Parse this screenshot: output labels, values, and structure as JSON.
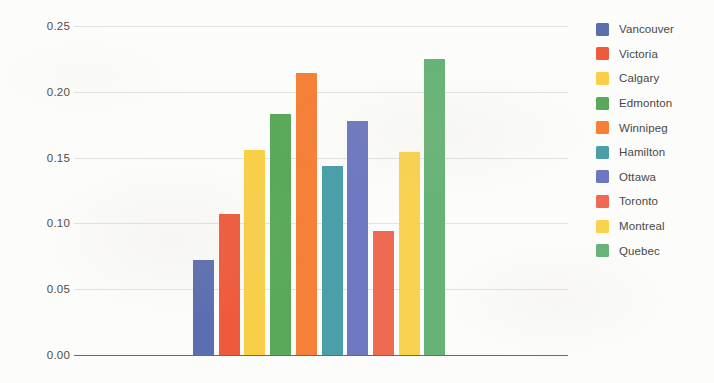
{
  "chart_data": {
    "type": "bar",
    "title": "",
    "xlabel": "",
    "ylabel": "",
    "ylim": [
      0.0,
      0.25
    ],
    "grid": true,
    "legend_position": "right",
    "categories": [
      "Vancouver",
      "Victoria",
      "Calgary",
      "Edmonton",
      "Winnipeg",
      "Hamilton",
      "Ottawa",
      "Toronto",
      "Montreal",
      "Quebec"
    ],
    "values": [
      0.072,
      0.107,
      0.156,
      0.183,
      0.214,
      0.144,
      0.178,
      0.094,
      0.154,
      0.225
    ],
    "colors": [
      "#5b6eb0",
      "#f05a3c",
      "#f9cf4a",
      "#5aa95a",
      "#f58038",
      "#4a9fa8",
      "#6e78c0",
      "#ee6a52",
      "#f9d24f",
      "#67b377"
    ],
    "ytick_labels": [
      "0.25",
      "0.20",
      "0.15",
      "0.10",
      "0.05",
      "0.00"
    ],
    "ytick_values": [
      0.25,
      0.2,
      0.15,
      0.1,
      0.05,
      0.0
    ],
    "bars": [
      {
        "label": "Vancouver",
        "value": 0.072,
        "color": "#5b6eb0"
      },
      {
        "label": "Victoria",
        "value": 0.107,
        "color": "#f05a3c"
      },
      {
        "label": "Calgary",
        "value": 0.156,
        "color": "#f9cf4a"
      },
      {
        "label": "Edmonton",
        "value": 0.183,
        "color": "#5aa95a"
      },
      {
        "label": "Winnipeg",
        "value": 0.214,
        "color": "#f58038"
      },
      {
        "label": "Hamilton",
        "value": 0.144,
        "color": "#4a9fa8"
      },
      {
        "label": "Ottawa",
        "value": 0.178,
        "color": "#6e78c0"
      },
      {
        "label": "Toronto",
        "value": 0.094,
        "color": "#ee6a52"
      },
      {
        "label": "Montreal",
        "value": 0.154,
        "color": "#f9d24f"
      },
      {
        "label": "Quebec",
        "value": 0.225,
        "color": "#67b377"
      }
    ]
  },
  "legend": {
    "items": [
      {
        "label": "Vancouver",
        "color": "#5b6eb0"
      },
      {
        "label": "Victoria",
        "color": "#f05a3c"
      },
      {
        "label": "Calgary",
        "color": "#f9cf4a"
      },
      {
        "label": "Edmonton",
        "color": "#5aa95a"
      },
      {
        "label": "Winnipeg",
        "color": "#f58038"
      },
      {
        "label": "Hamilton",
        "color": "#4a9fa8"
      },
      {
        "label": "Ottawa",
        "color": "#6e78c0"
      },
      {
        "label": "Toronto",
        "color": "#ee6a52"
      },
      {
        "label": "Montreal",
        "color": "#f9d24f"
      },
      {
        "label": "Quebec",
        "color": "#67b377"
      }
    ]
  },
  "axes": {
    "gridline_color": "#e2e2e0",
    "zero_axis_color": "#6b6b66",
    "tick_text_color": "#4e4c49"
  }
}
